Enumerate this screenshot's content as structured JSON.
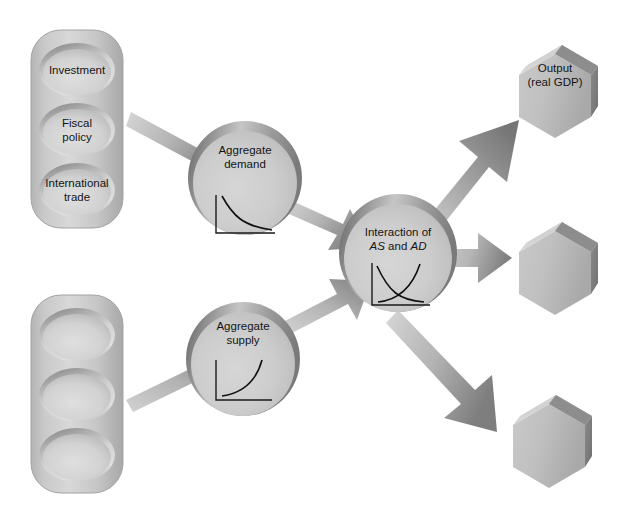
{
  "diagram": {
    "colors": {
      "shape_fill_light": "#d2d2d2",
      "shape_fill_mid": "#b9b9b9",
      "shape_fill_dark": "#8f8f8f",
      "shape_rim_dark": "#6e6e6e",
      "arrow_light": "#c9c9c9",
      "arrow_dark": "#7d7d7d",
      "text": "#141414",
      "background": "#ffffff",
      "curve_stroke": "#101010",
      "axis_stroke": "#1a1a1a"
    },
    "inputs_top": {
      "name": "demand-inputs-cylinder",
      "items": [
        {
          "id": "investment",
          "label": "Investment"
        },
        {
          "id": "fiscal-policy",
          "label_line1": "Fiscal",
          "label_line2": "policy"
        },
        {
          "id": "international-trade",
          "label_line1": "International",
          "label_line2": "trade"
        }
      ]
    },
    "inputs_bottom": {
      "name": "supply-inputs-cylinder",
      "items": [
        {
          "id": "supply-input-1",
          "label": ""
        },
        {
          "id": "supply-input-2",
          "label": ""
        },
        {
          "id": "supply-input-3",
          "label": ""
        }
      ]
    },
    "circles": {
      "aggregate_demand": {
        "line1": "Aggregate",
        "line2": "demand",
        "chart": "downward-sloping-demand-curve"
      },
      "aggregate_supply": {
        "line1": "Aggregate",
        "line2": "supply",
        "chart": "upward-sloping-supply-curve"
      },
      "interaction": {
        "line1": "Interaction of",
        "line2_pre": "",
        "line2_as": "AS",
        "line2_mid": " and ",
        "line2_ad": "AD",
        "chart": "as-ad-crossing-curves"
      }
    },
    "outputs": [
      {
        "id": "output-real-gdp",
        "line1": "Output",
        "line2": "(real GDP)"
      },
      {
        "id": "output-hexagon-2",
        "line1": "",
        "line2": ""
      },
      {
        "id": "output-hexagon-3",
        "line1": "",
        "line2": ""
      }
    ],
    "arrows": [
      {
        "id": "arrow-demand-inputs-to-ad",
        "direction": "down-right"
      },
      {
        "id": "arrow-supply-inputs-to-as",
        "direction": "up-right"
      },
      {
        "id": "arrow-ad-to-interaction",
        "direction": "down-right"
      },
      {
        "id": "arrow-as-to-interaction",
        "direction": "up-right"
      },
      {
        "id": "arrow-interaction-to-output-1",
        "direction": "up-right"
      },
      {
        "id": "arrow-interaction-to-output-2",
        "direction": "right"
      },
      {
        "id": "arrow-interaction-to-output-3",
        "direction": "down-right"
      }
    ]
  }
}
